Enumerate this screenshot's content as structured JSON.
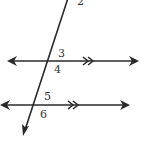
{
  "diagram": {
    "colors": {
      "line": "#2a2a2a",
      "label": "#333333",
      "background": "#ffffff"
    },
    "transversal": {
      "x1": 68,
      "y1": -2,
      "x2": 23,
      "y2": 136
    },
    "lines": [
      {
        "id": "upper",
        "y": 61,
        "x1": 7,
        "x2": 139,
        "parallel_marks_x": 85
      },
      {
        "id": "lower",
        "y": 105,
        "x1": 1,
        "x2": 130,
        "parallel_marks_x": 70
      }
    ],
    "angle_labels": [
      {
        "text": "2",
        "x": 77,
        "y": 5
      },
      {
        "text": "3",
        "x": 58,
        "y": 57
      },
      {
        "text": "4",
        "x": 54,
        "y": 73
      },
      {
        "text": "5",
        "x": 44,
        "y": 100
      },
      {
        "text": "6",
        "x": 40,
        "y": 118
      }
    ]
  }
}
